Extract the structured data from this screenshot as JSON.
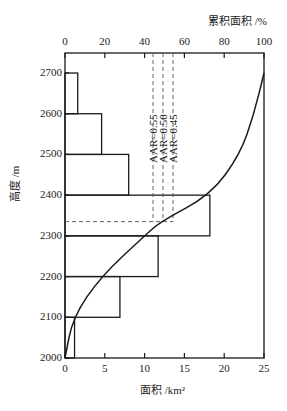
{
  "chart_data": {
    "type": "bar",
    "orientation": "horizontal",
    "title": "",
    "xlabel": "面积 /km²",
    "x2label": "累积面积 /%",
    "ylabel": "高度 /m",
    "xlim": [
      0,
      25
    ],
    "x2lim": [
      0,
      100
    ],
    "ylim": [
      2000,
      2750
    ],
    "x_ticks": [
      "0",
      "5",
      "10",
      "15",
      "20",
      "25"
    ],
    "x2_ticks": [
      "0",
      "20",
      "40",
      "60",
      "80",
      "100"
    ],
    "y_ticks": [
      "2000",
      "2100",
      "2200",
      "2300",
      "2400",
      "2500",
      "2600",
      "2700"
    ],
    "bars": [
      {
        "from": 2000,
        "to": 2100,
        "area_km2": 1.2
      },
      {
        "from": 2100,
        "to": 2200,
        "area_km2": 6.9
      },
      {
        "from": 2200,
        "to": 2300,
        "area_km2": 11.7
      },
      {
        "from": 2300,
        "to": 2400,
        "area_km2": 18.2
      },
      {
        "from": 2400,
        "to": 2500,
        "area_km2": 8.0
      },
      {
        "from": 2500,
        "to": 2600,
        "area_km2": 4.6
      },
      {
        "from": 2600,
        "to": 2700,
        "area_km2": 1.6
      }
    ],
    "series": [
      {
        "name": "累积面积曲线",
        "type": "line",
        "axis": "x2",
        "points": [
          [
            0,
            2000
          ],
          [
            4,
            2100
          ],
          [
            18,
            2200
          ],
          [
            40,
            2300
          ],
          [
            48,
            2335
          ],
          [
            73,
            2400
          ],
          [
            88,
            2500
          ],
          [
            95,
            2600
          ],
          [
            100,
            2700
          ]
        ]
      }
    ],
    "annotations": [
      {
        "text": "AAR=0.55",
        "x2": 45
      },
      {
        "text": "AAR=0.50",
        "x2": 50
      },
      {
        "text": "AAR=0.45",
        "x2": 55
      },
      {
        "type": "hline",
        "y": 2335
      }
    ],
    "grid": false,
    "legend": "none"
  }
}
